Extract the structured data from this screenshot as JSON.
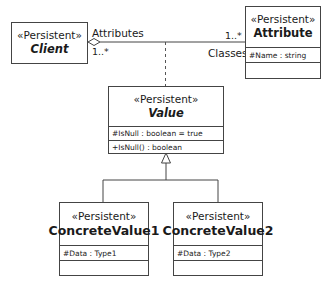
{
  "diagram": {
    "type": "UML class diagram",
    "classes": {
      "client": {
        "stereotype": "«Persistent»",
        "name": "Client",
        "abstract": true
      },
      "attribute": {
        "stereotype": "«Persistent»",
        "name": "Attribute",
        "attributes": [
          "#Name : string"
        ],
        "operations": []
      },
      "value": {
        "stereotype": "«Persistent»",
        "name": "Value",
        "abstract": true,
        "attributes": [
          "#IsNull : boolean = true"
        ],
        "operations": [
          "+IsNull() : boolean"
        ]
      },
      "concrete_value1": {
        "stereotype": "«Persistent»",
        "name": "ConcreteValue1",
        "attributes": [
          "#Data : Type1"
        ],
        "operations": []
      },
      "concrete_value2": {
        "stereotype": "«Persistent»",
        "name": "ConcreteValue2",
        "attributes": [
          "#Data : Type2"
        ],
        "operations": []
      }
    },
    "association": {
      "client_role": "Attributes",
      "client_multiplicity": "1..*",
      "attribute_role": "Classes",
      "attribute_multiplicity": "1..*",
      "kind": "aggregation"
    },
    "association_class": "Value",
    "generalization": {
      "parent": "Value",
      "children": [
        "ConcreteValue1",
        "ConcreteValue2"
      ]
    }
  }
}
